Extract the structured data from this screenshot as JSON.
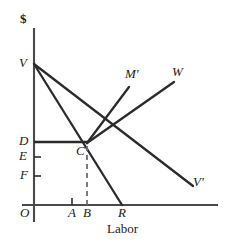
{
  "figure": {
    "type": "economics-line-diagram",
    "background_color": "#ffffff",
    "line_color": "#2b2b2b",
    "axis_color": "#4a4a4a",
    "width": 231,
    "height": 247
  },
  "axes": {
    "y_axis_label": "$",
    "x_axis_label": "Labor",
    "origin_label": "O"
  },
  "y_axis_ticks": [
    {
      "label": "V",
      "y": 64
    },
    {
      "label": "D",
      "y": 142
    },
    {
      "label": "E",
      "y": 157
    },
    {
      "label": "F",
      "y": 176
    }
  ],
  "x_axis_ticks": [
    {
      "label": "A",
      "x": 72
    },
    {
      "label": "B",
      "x": 87
    },
    {
      "label": "R",
      "x": 122
    }
  ],
  "curve_labels": [
    {
      "label": "M'",
      "x": 128,
      "y": 74
    },
    {
      "label": "W",
      "x": 175,
      "y": 72
    },
    {
      "label": "V'",
      "x": 196,
      "y": 182
    }
  ],
  "points": [
    {
      "label": "C",
      "x": 87,
      "y": 143
    }
  ],
  "lines": {
    "v_to_r": {
      "from": [
        34,
        64
      ],
      "to": [
        122,
        205
      ],
      "style": "solid",
      "note": "steep falling line V through C to R"
    },
    "v_to_vprime": {
      "from": [
        34,
        64
      ],
      "to": [
        193,
        186
      ],
      "style": "solid",
      "note": "shallower falling line V to V'"
    },
    "c_to_mprime": {
      "from": [
        87,
        143
      ],
      "to": [
        129,
        87
      ],
      "style": "solid",
      "note": "rising line from C up to M'"
    },
    "c_to_w": {
      "from": [
        87,
        143
      ],
      "to": [
        174,
        82
      ],
      "style": "solid",
      "note": "rising line from C up to W"
    },
    "d_to_c": {
      "from": [
        34,
        142
      ],
      "to": [
        87,
        142
      ],
      "style": "solid",
      "note": "horizontal price line D to C"
    },
    "c_to_b": {
      "from": [
        87,
        143
      ],
      "to": [
        87,
        205
      ],
      "style": "dashed",
      "note": "vertical dashed drop from C to B"
    }
  },
  "tick_marks": {
    "e_tick": {
      "from": [
        34,
        157
      ],
      "to": [
        41,
        157
      ]
    },
    "f_tick": {
      "from": [
        34,
        176
      ],
      "to": [
        41,
        176
      ]
    },
    "a_tick": {
      "from": [
        72,
        199
      ],
      "to": [
        72,
        205
      ]
    },
    "b_tick": {
      "from": [
        87,
        198
      ],
      "to": [
        87,
        205
      ]
    }
  }
}
